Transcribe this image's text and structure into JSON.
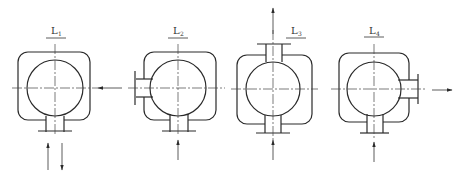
{
  "diagram": {
    "type": "nozzle-orientation-schematic",
    "colors": {
      "line": "#2a2a2a",
      "background": "#ffffff"
    },
    "views": [
      {
        "id": "L1",
        "label": "L",
        "subscript": "1",
        "inlet": "bottom",
        "outlet": "bottom",
        "side_flow": "in-from-right",
        "arrows": [
          "left-pointing arrow entering from right",
          "up arrow below",
          "down arrow below"
        ]
      },
      {
        "id": "L2",
        "label": "L",
        "subscript": "2",
        "inlet": "bottom",
        "outlet": "left",
        "arrows": [
          "up arrow below"
        ]
      },
      {
        "id": "L3",
        "label": "L",
        "subscript": "3",
        "inlet": "bottom",
        "outlet": "top",
        "arrows": [
          "up arrow above",
          "up arrow below"
        ]
      },
      {
        "id": "L4",
        "label": "L",
        "subscript": "4",
        "inlet": "bottom",
        "outlet": "right",
        "arrows": [
          "up arrow below",
          "right arrow at right"
        ]
      }
    ]
  }
}
